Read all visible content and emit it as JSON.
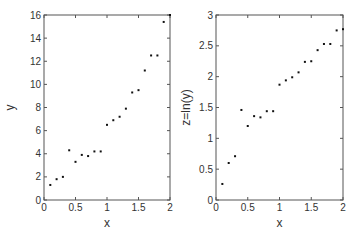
{
  "chart_data": [
    {
      "type": "scatter",
      "title": "",
      "xlabel": "x",
      "ylabel": "y",
      "xlim": [
        0,
        2
      ],
      "ylim": [
        0,
        16
      ],
      "xticks": [
        "0",
        "0.5",
        "1",
        "1.5",
        "2"
      ],
      "yticks": [
        "0",
        "2",
        "4",
        "6",
        "8",
        "10",
        "12",
        "14",
        "16"
      ],
      "grid": false,
      "legend": null,
      "x": [
        0.1,
        0.2,
        0.3,
        0.4,
        0.5,
        0.6,
        0.7,
        0.8,
        0.9,
        1.0,
        1.1,
        1.2,
        1.3,
        1.4,
        1.5,
        1.6,
        1.7,
        1.8,
        1.9,
        2.0
      ],
      "y": [
        1.3,
        1.8,
        2.0,
        4.3,
        3.3,
        3.9,
        3.8,
        4.2,
        4.2,
        6.5,
        6.9,
        7.2,
        7.9,
        9.3,
        9.5,
        11.2,
        12.5,
        12.5,
        15.4,
        16.0
      ]
    },
    {
      "type": "scatter",
      "title": "",
      "xlabel": "x",
      "ylabel": "z=ln(y)",
      "xlim": [
        0,
        2
      ],
      "ylim": [
        0,
        3
      ],
      "xticks": [
        "0",
        "0.5",
        "1",
        "1.5",
        "2"
      ],
      "yticks": [
        "0",
        "0.5",
        "1",
        "1.5",
        "2",
        "2.5",
        "3"
      ],
      "grid": false,
      "legend": null,
      "x": [
        0.1,
        0.2,
        0.3,
        0.4,
        0.5,
        0.6,
        0.7,
        0.8,
        0.9,
        1.0,
        1.1,
        1.2,
        1.3,
        1.4,
        1.5,
        1.6,
        1.7,
        1.8,
        1.9,
        2.0
      ],
      "y": [
        0.26,
        0.6,
        0.71,
        1.46,
        1.2,
        1.36,
        1.34,
        1.44,
        1.44,
        1.87,
        1.94,
        1.99,
        2.07,
        2.24,
        2.25,
        2.43,
        2.53,
        2.53,
        2.75,
        2.77
      ]
    }
  ]
}
